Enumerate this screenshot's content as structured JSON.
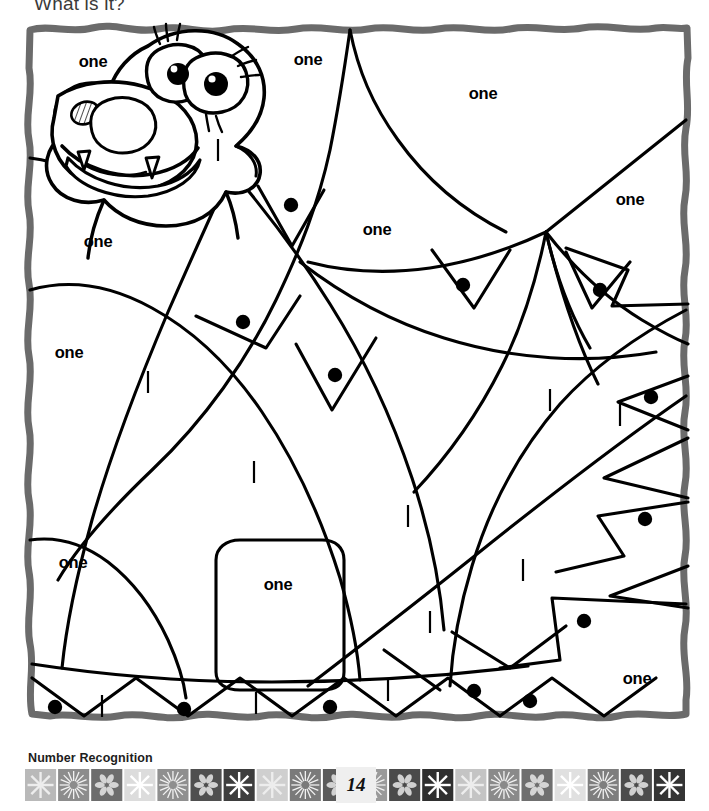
{
  "worksheet": {
    "instruction": "What is it?",
    "subject_label": "Number Recognition",
    "page_number": "14",
    "picture_subject": "hippopotamus",
    "color_key_word": "one",
    "frame_color": "#6b6b6b",
    "line_color": "#000000",
    "background_color": "#ffffff",
    "page_number_background": "#efefef"
  },
  "regions": {
    "word_labels": [
      {
        "id": "one-1",
        "text": "one",
        "x": 93,
        "y": 67
      },
      {
        "id": "one-2",
        "text": "one",
        "x": 308,
        "y": 65
      },
      {
        "id": "one-3",
        "text": "one",
        "x": 483,
        "y": 99
      },
      {
        "id": "one-4",
        "text": "one",
        "x": 630,
        "y": 205
      },
      {
        "id": "one-5",
        "text": "one",
        "x": 98,
        "y": 247
      },
      {
        "id": "one-6",
        "text": "one",
        "x": 377,
        "y": 235
      },
      {
        "id": "one-7",
        "text": "one",
        "x": 69,
        "y": 358
      },
      {
        "id": "one-8",
        "text": "one",
        "x": 73,
        "y": 568
      },
      {
        "id": "one-9",
        "text": "one",
        "x": 278,
        "y": 590
      },
      {
        "id": "one-10",
        "text": "one",
        "x": 637,
        "y": 684
      }
    ],
    "dots": [
      {
        "id": "dot-1",
        "x": 291,
        "y": 205
      },
      {
        "id": "dot-2",
        "x": 463,
        "y": 285
      },
      {
        "id": "dot-3",
        "x": 600,
        "y": 290
      },
      {
        "id": "dot-4",
        "x": 243,
        "y": 322
      },
      {
        "id": "dot-5",
        "x": 335,
        "y": 375
      },
      {
        "id": "dot-6",
        "x": 651,
        "y": 397
      },
      {
        "id": "dot-7",
        "x": 645,
        "y": 519
      },
      {
        "id": "dot-8",
        "x": 584,
        "y": 621
      },
      {
        "id": "dot-9",
        "x": 55,
        "y": 707
      },
      {
        "id": "dot-10",
        "x": 184,
        "y": 709
      },
      {
        "id": "dot-11",
        "x": 330,
        "y": 707
      },
      {
        "id": "dot-12",
        "x": 474,
        "y": 691
      },
      {
        "id": "dot-13",
        "x": 530,
        "y": 701
      }
    ],
    "tally_marks": [
      {
        "id": "tally-1",
        "x": 218,
        "y": 150
      },
      {
        "id": "tally-2",
        "x": 148,
        "y": 382
      },
      {
        "id": "tally-3",
        "x": 550,
        "y": 400
      },
      {
        "id": "tally-4",
        "x": 254,
        "y": 472
      },
      {
        "id": "tally-5",
        "x": 408,
        "y": 516
      },
      {
        "id": "tally-6",
        "x": 523,
        "y": 570
      },
      {
        "id": "tally-7",
        "x": 430,
        "y": 622
      },
      {
        "id": "tally-8",
        "x": 102,
        "y": 706
      },
      {
        "id": "tally-9",
        "x": 256,
        "y": 703
      },
      {
        "id": "tally-10",
        "x": 388,
        "y": 690
      },
      {
        "id": "tally-11",
        "x": 620,
        "y": 415
      }
    ]
  },
  "footer_band": {
    "tiles": [
      {
        "shade": "#b9b9b9",
        "motif": "starburst"
      },
      {
        "shade": "#8c8c8c",
        "motif": "radial"
      },
      {
        "shade": "#6d6d6d",
        "motif": "floral"
      },
      {
        "shade": "#dcdcdc",
        "motif": "star"
      },
      {
        "shade": "#8f8f8f",
        "motif": "radial"
      },
      {
        "shade": "#4f4f4f",
        "motif": "floral"
      },
      {
        "shade": "#3d3d3d",
        "motif": "star"
      },
      {
        "shade": "#cfcfcf",
        "motif": "starburst"
      },
      {
        "shade": "#7a7a7a",
        "motif": "radial"
      },
      {
        "shade": "#5a5a5a",
        "motif": "floral"
      },
      {
        "shade": "#9a9a9a",
        "motif": "radial"
      },
      {
        "shade": "#4a4a4a",
        "motif": "floral"
      },
      {
        "shade": "#2f2f2f",
        "motif": "star"
      },
      {
        "shade": "#c4c4c4",
        "motif": "starburst"
      },
      {
        "shade": "#8a8a8a",
        "motif": "radial"
      },
      {
        "shade": "#6f6f6f",
        "motif": "floral"
      },
      {
        "shade": "#e0e0e0",
        "motif": "star"
      },
      {
        "shade": "#7e7e7e",
        "motif": "radial"
      },
      {
        "shade": "#4c4c4c",
        "motif": "floral"
      },
      {
        "shade": "#343434",
        "motif": "star"
      }
    ]
  }
}
